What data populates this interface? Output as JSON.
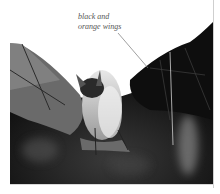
{
  "figure": {
    "image_style": "grayscale photograph",
    "caption": {
      "line1": "black and",
      "line2": "orange wings"
    },
    "leader_line": {
      "from": [
        118,
        33
      ],
      "to": [
        148,
        68
      ]
    }
  },
  "colors": {
    "background": "#ffffff",
    "caption_text": "#555555",
    "wing_dark": "#111111",
    "body_light": "#d9d9d9"
  }
}
